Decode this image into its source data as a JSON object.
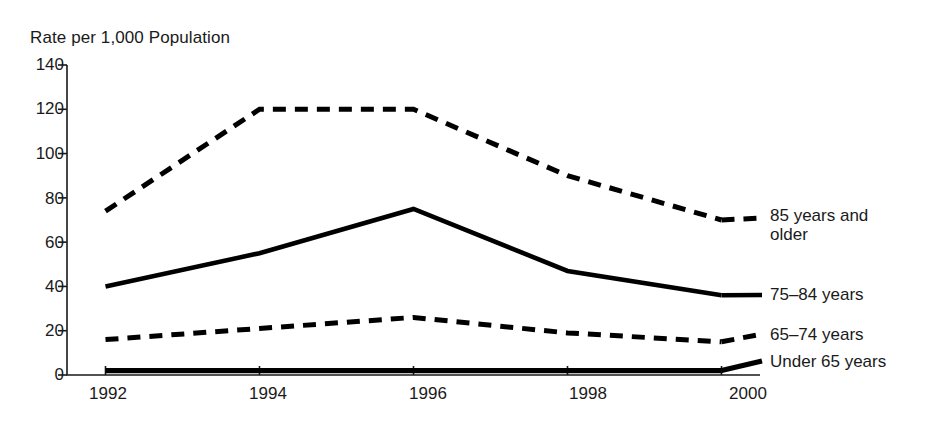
{
  "chart_data": {
    "type": "line",
    "title": "Rate per 1,000 Population",
    "xlabel": "",
    "ylabel": "Rate per 1,000 Population",
    "x": [
      1992,
      1994,
      1996,
      1998,
      2000
    ],
    "categories": [
      "1992",
      "1994",
      "1996",
      "1998",
      "2000"
    ],
    "xlim": [
      1991.5,
      2000.5
    ],
    "ylim": [
      0,
      140
    ],
    "y_ticks": [
      0,
      20,
      40,
      60,
      80,
      100,
      120,
      140
    ],
    "x_ticks": [
      "1992",
      "1994",
      "1996",
      "1998",
      "2000"
    ],
    "grid": false,
    "legend_position": "right-inline",
    "series": [
      {
        "name": "85 years and older",
        "label_line1": "85 years and",
        "label_line2": "older",
        "style": "dashed",
        "values": [
          74,
          120,
          120,
          90,
          70
        ]
      },
      {
        "name": "75–84 years",
        "label_line1": "75–84 years",
        "label_line2": "",
        "style": "solid",
        "values": [
          40,
          55,
          75,
          47,
          36
        ]
      },
      {
        "name": "65–74 years",
        "label_line1": "65–74 years",
        "label_line2": "",
        "style": "dashed",
        "values": [
          16,
          21,
          26,
          19,
          15
        ]
      },
      {
        "name": "Under 65 years",
        "label_line1": "Under 65 years",
        "label_line2": "",
        "style": "solid-thick",
        "values": [
          2,
          2,
          2,
          2,
          2
        ]
      }
    ]
  },
  "axis": {
    "y_labels": [
      "140",
      "120",
      "100",
      "80",
      "60",
      "40",
      "20",
      "0"
    ],
    "x_labels": [
      "1992",
      "1994",
      "1996",
      "1998",
      "2000"
    ]
  },
  "legend": {
    "items": [
      {
        "line1": "85 years and",
        "line2": "older"
      },
      {
        "line1": "75–84 years",
        "line2": ""
      },
      {
        "line1": "65–74 years",
        "line2": ""
      },
      {
        "line1": "Under 65 years",
        "line2": ""
      }
    ]
  },
  "colors": {
    "ink": "#000000",
    "background": "#ffffff"
  }
}
